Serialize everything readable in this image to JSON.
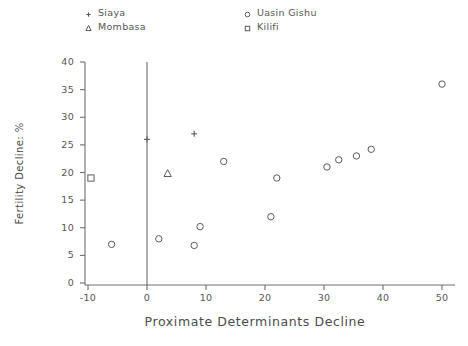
{
  "chart_data": {
    "type": "scatter",
    "title": "",
    "xlabel": "Proximate Determinants Decline",
    "ylabel": "Fertility Decline: %",
    "xlim": [
      -13,
      53
    ],
    "ylim": [
      0,
      41
    ],
    "xticks": [
      -10,
      0,
      10,
      20,
      30,
      40,
      50
    ],
    "yticks": [
      0,
      5,
      10,
      15,
      20,
      25,
      30,
      35,
      40
    ],
    "xtick_labels": [
      "-10",
      "0",
      "10",
      "20",
      "30",
      "40",
      "50"
    ],
    "ytick_labels": [
      "0",
      "5",
      "10",
      "15",
      "20",
      "25",
      "30",
      "35",
      "40"
    ],
    "grid": false,
    "legend_position": "top",
    "reference_line_x": 0,
    "series": [
      {
        "name": "Siaya",
        "marker": "plus",
        "points": [
          {
            "x": 0,
            "y": 26
          },
          {
            "x": 8,
            "y": 27
          }
        ]
      },
      {
        "name": "Mombasa",
        "marker": "triangle",
        "points": [
          {
            "x": 3.5,
            "y": 19.8
          }
        ]
      },
      {
        "name": "Uasin Gishu",
        "marker": "circle",
        "points": [
          {
            "x": -6,
            "y": 7
          },
          {
            "x": 2,
            "y": 8
          },
          {
            "x": 9,
            "y": 10.2
          },
          {
            "x": 8,
            "y": 6.8
          },
          {
            "x": 13,
            "y": 22
          },
          {
            "x": 21,
            "y": 12
          },
          {
            "x": 22,
            "y": 19
          },
          {
            "x": 30.5,
            "y": 21
          },
          {
            "x": 32.5,
            "y": 22.3
          },
          {
            "x": 35.5,
            "y": 23
          },
          {
            "x": 38,
            "y": 24.2
          },
          {
            "x": 50,
            "y": 36
          }
        ]
      },
      {
        "name": "Kilifi",
        "marker": "square",
        "points": [
          {
            "x": -9.5,
            "y": 19
          }
        ]
      }
    ]
  },
  "legend": {
    "entries": [
      {
        "label": "Siaya",
        "marker": "plus"
      },
      {
        "label": "Mombasa",
        "marker": "triangle"
      },
      {
        "label": "Uasin Gishu",
        "marker": "circle"
      },
      {
        "label": "Kilifi",
        "marker": "square"
      }
    ]
  },
  "axes": {
    "x_title": "Proximate Determinants Decline",
    "y_title": "Fertility Decline: %"
  },
  "colors": {
    "axis": "#6e6e6e",
    "text": "#4a4a4a",
    "marker": "#5a5a5a",
    "background": "#ffffff"
  }
}
